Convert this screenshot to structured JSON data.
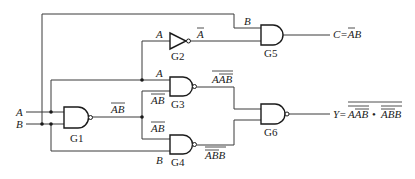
{
  "diagram": {
    "type": "logic-circuit",
    "inputs": [
      {
        "id": "A",
        "label": "A"
      },
      {
        "id": "B",
        "label": "B"
      }
    ],
    "gates": [
      {
        "id": "G1",
        "label": "G1",
        "type": "NAND",
        "inputs": [
          "A",
          "B"
        ],
        "output": "AB_bar",
        "output_label": "AB"
      },
      {
        "id": "G2",
        "label": "G2",
        "type": "NOT",
        "inputs": [
          "A"
        ],
        "output": "A_bar",
        "input_label": "A",
        "output_label": "A"
      },
      {
        "id": "G3",
        "label": "G3",
        "type": "NAND",
        "inputs": [
          "A",
          "AB_bar"
        ],
        "input_labels": [
          "A",
          "AB"
        ],
        "output_label": "AAB"
      },
      {
        "id": "G4",
        "label": "G4",
        "type": "NAND",
        "inputs": [
          "AB_bar",
          "B"
        ],
        "input_labels": [
          "AB",
          "B"
        ],
        "output_label": "ABB"
      },
      {
        "id": "G5",
        "label": "G5",
        "type": "AND",
        "inputs": [
          "B",
          "A_bar"
        ],
        "input_labels": [
          "B",
          "A"
        ],
        "output": "C"
      },
      {
        "id": "G6",
        "label": "G6",
        "type": "NAND",
        "inputs": [
          "G3",
          "G4"
        ],
        "output": "Y"
      }
    ],
    "outputs": [
      {
        "id": "C",
        "prefix": "C=",
        "expression_text": "AB",
        "expression": "C = (NOT A) AND B"
      },
      {
        "id": "Y",
        "prefix": "Y=",
        "term1": "AAB",
        "dot": "•",
        "term2": "ABB",
        "expression": "Y = NOT( NOT(A·NOT(AB)) · NOT(NOT(AB)·B) )"
      }
    ]
  },
  "labels": {
    "in_A": "A",
    "in_B": "B",
    "g1_out": "AB",
    "g2_in": "A",
    "g2_out": "A",
    "g3_in_A": "A",
    "g3_in_AB": "AB",
    "g3_out": "AAB",
    "g4_in_AB": "AB",
    "g4_in_B": "B",
    "g4_out": "ABB",
    "g5_in_B": "B",
    "c_out": "C=AB",
    "y_prefix": "Y=",
    "y_term1": "AAB",
    "y_dot": "•",
    "y_term2": "ABB",
    "G1": "G1",
    "G2": "G2",
    "G3": "G3",
    "G4": "G4",
    "G5": "G5",
    "G6": "G6"
  }
}
